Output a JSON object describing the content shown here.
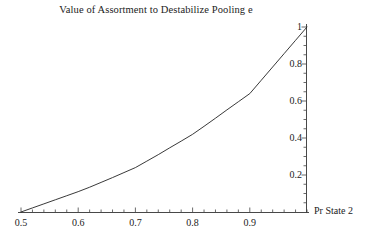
{
  "chart_data": {
    "type": "line",
    "title": "Value of Assortment to Destabilize Pooling e",
    "xlabel": "Pr State 2",
    "ylabel": "",
    "xlim": [
      0.49,
      1.0
    ],
    "ylim": [
      0.0,
      1.0
    ],
    "grid": false,
    "legend": null,
    "x_ticks": [
      {
        "value": 0.5,
        "label": "0.5"
      },
      {
        "value": 0.6,
        "label": "0.6"
      },
      {
        "value": 0.7,
        "label": "0.7"
      },
      {
        "value": 0.8,
        "label": "0.8"
      },
      {
        "value": 0.9,
        "label": "0.9"
      }
    ],
    "y_ticks": [
      {
        "value": 0.2,
        "label": "0.2"
      },
      {
        "value": 0.4,
        "label": "0.4"
      },
      {
        "value": 0.6,
        "label": "0.6"
      },
      {
        "value": 0.8,
        "label": "0.8"
      },
      {
        "value": 1.0,
        "label": "1"
      }
    ],
    "series": [
      {
        "name": "Value of Assortment",
        "color": "#222222",
        "x": [
          0.5,
          0.52,
          0.54,
          0.56,
          0.58,
          0.6,
          0.62,
          0.64,
          0.66,
          0.68,
          0.7,
          0.72,
          0.74,
          0.76,
          0.78,
          0.8,
          0.82,
          0.84,
          0.86,
          0.88,
          0.9,
          0.92,
          0.94,
          0.96,
          0.98,
          1.0
        ],
        "values": [
          0.0,
          0.022,
          0.044,
          0.066,
          0.088,
          0.11,
          0.134,
          0.16,
          0.186,
          0.213,
          0.24,
          0.275,
          0.31,
          0.347,
          0.383,
          0.42,
          0.463,
          0.507,
          0.552,
          0.596,
          0.64,
          0.712,
          0.784,
          0.856,
          0.928,
          1.0
        ]
      }
    ]
  },
  "axes": {
    "x_axis_name": "horizontal-axis",
    "y_axis_name": "vertical-axis"
  }
}
